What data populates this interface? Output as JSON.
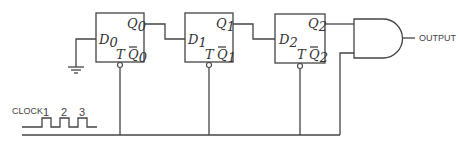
{
  "diagram": {
    "type": "sequential logic circuit",
    "flip_flops": [
      {
        "id": "ff0",
        "input_label": "D",
        "input_sub": "0",
        "q_label": "Q",
        "q_sub": "0",
        "clock_label": "T",
        "qbar_label": "Q",
        "qbar_sub": "0",
        "input_source": "ground"
      },
      {
        "id": "ff1",
        "input_label": "D",
        "input_sub": "1",
        "q_label": "Q",
        "q_sub": "1",
        "clock_label": "T",
        "qbar_label": "Q",
        "qbar_sub": "1",
        "input_source": "Q0"
      },
      {
        "id": "ff2",
        "input_label": "D",
        "input_sub": "2",
        "q_label": "Q",
        "q_sub": "2",
        "clock_label": "T",
        "qbar_label": "Q",
        "qbar_sub": "2",
        "input_source": "Q1"
      }
    ],
    "gate": {
      "type": "AND",
      "inputs": [
        "Q2",
        "CLOCK"
      ],
      "output_label": "OUTPUT"
    },
    "clock": {
      "label": "CLOCK",
      "pulse_labels": [
        "1",
        "2",
        "3"
      ]
    },
    "colors": {
      "line": "#444444",
      "background": "#ffffff"
    }
  }
}
